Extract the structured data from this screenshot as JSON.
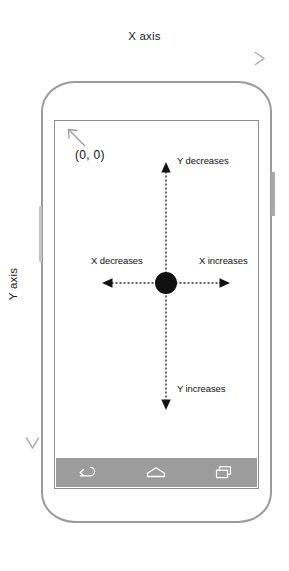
{
  "diagram": {
    "x_axis_label": "X axis",
    "y_axis_label": "Y axis"
  },
  "screen_annotations": {
    "origin": "(0, 0)",
    "y_decreases": "Y decreases",
    "y_increases": "Y increases",
    "x_decreases": "X decreases",
    "x_increases": "X increases"
  },
  "icons": {
    "origin_pointer": "arrow-up-left-icon",
    "x_axis_arrow": "arrow-right-icon",
    "y_axis_arrow": "arrow-down-icon",
    "center_point": "origin-dot-icon",
    "up_arrow": "arrow-up-icon",
    "down_arrow": "arrow-down-icon",
    "left_arrow": "arrow-left-icon",
    "right_arrow": "arrow-right-icon"
  },
  "navbar": {
    "back": "back-icon",
    "home": "home-icon",
    "recents": "recents-icon"
  },
  "device": {
    "power_button": "power-button",
    "volume_button": "volume-button"
  },
  "colors": {
    "device_outline": "#9b9b9b",
    "screen_outline": "#8f8f8f",
    "navbar_background": "#9c9c9c",
    "axis_gray": "#b8b8b8",
    "text": "#111111",
    "center_dot": "#111111"
  }
}
